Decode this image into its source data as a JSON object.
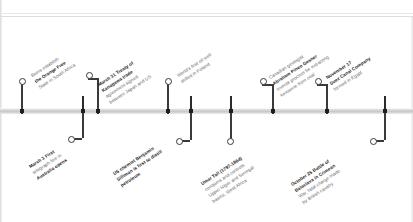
{
  "document": {
    "kind": "historical-timeline",
    "orientation": "horizontal",
    "era": "1854"
  },
  "axis": {
    "style": "horizontal-bar",
    "color": "#c8c8c8"
  },
  "events": [
    {
      "id": "orange-free-state",
      "side": "above",
      "date": "",
      "lines": [
        {
          "text": "Boers establish",
          "bold": false
        },
        {
          "text": "the Orange Free",
          "bold": true
        },
        {
          "text": "State in South Africa",
          "bold": false
        }
      ],
      "full_text": "Boers establish the Orange Free State in South Africa"
    },
    {
      "id": "treaty-of-kanagawa",
      "side": "above",
      "date": "March 31",
      "lines": [
        {
          "text": "March 31 Treaty of",
          "bold": true
        },
        {
          "text": "Kanagawa trade",
          "bold": true
        },
        {
          "text": "agreement signed",
          "bold": false
        },
        {
          "text": "between Japan and US",
          "bold": false
        }
      ],
      "full_text": "March 31 Treaty of Kanagawa trade agreement signed between Japan and US"
    },
    {
      "id": "first-oil-well-poland",
      "side": "above",
      "date": "",
      "lines": [
        {
          "text": "World's first oil well",
          "bold": false
        },
        {
          "text": "drilled in Poland",
          "bold": false
        }
      ],
      "full_text": "World's first oil well drilled in Poland"
    },
    {
      "id": "gesner-kerosene",
      "side": "above",
      "date": "",
      "lines": [
        {
          "text": "Canadian geologist",
          "bold": false
        },
        {
          "text": "Abraham Pineo Gesner",
          "bold": true
        },
        {
          "text": "invents process for extracting",
          "bold": false
        },
        {
          "text": "kerosene from coal",
          "bold": false
        }
      ],
      "full_text": "Canadian geologist Abraham Pineo Gesner invents process for extracting kerosene from coal"
    },
    {
      "id": "suez-canal-company",
      "side": "above",
      "date": "November 17",
      "lines": [
        {
          "text": "November 17",
          "bold": true
        },
        {
          "text": "Suez Canal Company",
          "bold": true
        },
        {
          "text": "formed in Egypt",
          "bold": false
        }
      ],
      "full_text": "November 17 Suez Canal Company formed in Egypt"
    },
    {
      "id": "australia-telegraph",
      "side": "below",
      "date": "March 3",
      "lines": [
        {
          "text": "March 3 First",
          "bold": true
        },
        {
          "text": "telegraph line in",
          "bold": false
        },
        {
          "text": "Australia opens",
          "bold": true
        }
      ],
      "full_text": "March 3 First telegraph line in Australia opens"
    },
    {
      "id": "silliman-petroleum",
      "side": "below",
      "date": "",
      "lines": [
        {
          "text": "US chemist Benjamin",
          "bold": true
        },
        {
          "text": "Silliman is first to distill",
          "bold": true
        },
        {
          "text": "petroleum",
          "bold": true
        }
      ],
      "full_text": "US chemist Benjamin Silliman is first to distill petroleum"
    },
    {
      "id": "umar-tall",
      "side": "below",
      "date": "",
      "lines": [
        {
          "text": "Umar Tall (1797-1864)",
          "bold": true
        },
        {
          "text": "conquers and controls",
          "bold": false
        },
        {
          "text": "Upper Niger and Senegal",
          "bold": false
        },
        {
          "text": "basins, West Africa",
          "bold": false
        }
      ],
      "full_text": "Umar Tall (1797-1864) conquers and controls Upper Niger and Senegal basins, West Africa"
    },
    {
      "id": "battle-of-balaclava",
      "side": "below",
      "date": "October 25",
      "lines": [
        {
          "text": "October 25 Battle of",
          "bold": true
        },
        {
          "text": "Balaclava in Crimean",
          "bold": true
        },
        {
          "text": "War, fatal charge made",
          "bold": false
        },
        {
          "text": "by British cavalry",
          "bold": false
        }
      ],
      "full_text": "October 25 Battle of Balaclava in Crimean War, fatal charge made by British cavalry"
    }
  ],
  "ticks": [
    21,
    82,
    97,
    167,
    190,
    230,
    272,
    326,
    384
  ]
}
